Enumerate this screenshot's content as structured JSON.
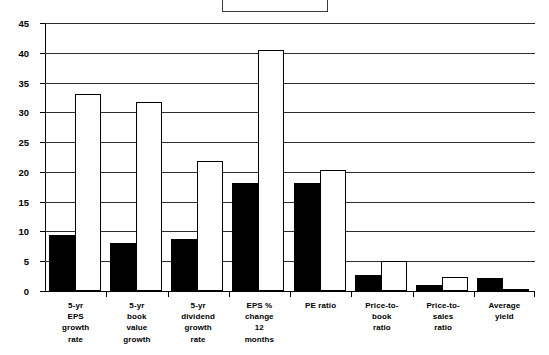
{
  "legend": {
    "label": ""
  },
  "chart_data": {
    "type": "bar",
    "title": "",
    "subtitle": "",
    "xlabel": "",
    "ylabel": "",
    "ylim": [
      0,
      45
    ],
    "yticks": [
      0,
      5,
      10,
      15,
      20,
      25,
      30,
      35,
      40,
      45
    ],
    "grid": true,
    "legend_position": "top-center",
    "legend_entries": [],
    "categories": [
      "5-yr EPS growth rate",
      "5-yr book value growth",
      "5-yr dividend growth rate",
      "EPS % change 12 months",
      "PE ratio",
      "Price-to-book ratio",
      "Price-to-sales ratio",
      "Average yield"
    ],
    "category_label_lines": [
      [
        "5-yr",
        "EPS",
        "growth",
        "rate"
      ],
      [
        "5-yr",
        "book",
        "value",
        "growth"
      ],
      [
        "5-yr",
        "dividend",
        "growth",
        "rate"
      ],
      [
        "EPS %",
        "change",
        "12",
        "months"
      ],
      [
        "PE  ratio"
      ],
      [
        "Price-to-",
        "book",
        "ratio"
      ],
      [
        "Price-to-",
        "sales",
        "ratio"
      ],
      [
        "Average",
        "yield"
      ]
    ],
    "series": [
      {
        "name": "Series 1",
        "color": "#000000",
        "fill": "solid-black",
        "values": [
          9.4,
          8.0,
          8.8,
          18.2,
          18.2,
          2.7,
          1.0,
          2.2
        ]
      },
      {
        "name": "Series 2",
        "color": "#ffffff",
        "fill": "white-outlined",
        "values": [
          33.0,
          31.8,
          21.8,
          40.4,
          20.4,
          5.0,
          2.4,
          0.4
        ]
      }
    ]
  },
  "colors": {
    "series_1": "#000000",
    "series_2": "#ffffff",
    "axis": "#000000",
    "grid": "#2d2d2d",
    "background": "#ffffff"
  }
}
